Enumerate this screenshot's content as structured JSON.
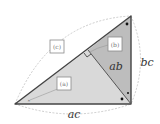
{
  "diagram": {
    "type": "right-triangle-altitude-similarity",
    "colors": {
      "triangle_a_fill": "#d9d9d9",
      "triangle_b_fill": "#bdbdbd",
      "edge": "#444444",
      "arc": "#b8b8b8"
    },
    "boxes": {
      "c": {
        "label": "(c)"
      },
      "b": {
        "label": "(b)"
      },
      "a": {
        "label": "(a)"
      }
    },
    "sides": {
      "ab": "ab",
      "bc": "bc",
      "ac": "ac"
    },
    "markers": {
      "angle_dot": "●",
      "angle_cross": "×"
    }
  }
}
